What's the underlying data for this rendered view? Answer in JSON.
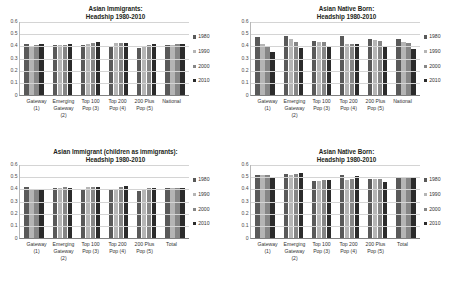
{
  "charts": [
    {
      "title_line1": "Asian Immigrants:",
      "title_line2": "Headship 1980-2010",
      "categories": [
        [
          "Gateway",
          "(1)"
        ],
        [
          "Emerging",
          "Gateway",
          "(2)"
        ],
        [
          "Top 100",
          "Pop (3)"
        ],
        [
          "Top 200",
          "Pop (4)"
        ],
        [
          "200 Plus",
          "Pop (5)"
        ],
        [
          "National"
        ]
      ],
      "series": [
        {
          "name": "1980",
          "values": [
            0.415,
            0.405,
            0.402,
            0.388,
            0.377,
            0.405
          ]
        },
        {
          "name": "1990",
          "values": [
            0.385,
            0.404,
            0.413,
            0.417,
            0.398,
            0.404
          ]
        },
        {
          "name": "2000",
          "values": [
            0.404,
            0.406,
            0.419,
            0.419,
            0.405,
            0.41
          ]
        },
        {
          "name": "2010",
          "values": [
            0.41,
            0.412,
            0.428,
            0.423,
            0.41,
            0.415
          ]
        }
      ]
    },
    {
      "title_line1": "Asian Native Born:",
      "title_line2": "Headship 1980-2010",
      "categories": [
        [
          "Gateway",
          "(1)"
        ],
        [
          "Emerging",
          "Gateway",
          "(2)"
        ],
        [
          "Top 100",
          "Pop (3)"
        ],
        [
          "Top 200",
          "Pop (4)"
        ],
        [
          "200 Plus",
          "Pop (5)"
        ],
        [
          "National"
        ]
      ],
      "series": [
        {
          "name": "1980",
          "values": [
            0.466,
            0.476,
            0.434,
            0.474,
            0.455,
            0.451
          ]
        },
        {
          "name": "1990",
          "values": [
            0.412,
            0.449,
            0.43,
            0.411,
            0.441,
            0.425
          ]
        },
        {
          "name": "2000",
          "values": [
            0.391,
            0.432,
            0.425,
            0.41,
            0.438,
            0.417
          ]
        },
        {
          "name": "2010",
          "values": [
            0.349,
            0.379,
            0.399,
            0.414,
            0.396,
            0.37
          ]
        }
      ]
    },
    {
      "title_line1": "Asian Immigrant (children as immigrants):",
      "title_line2": "Headship 1980-2010",
      "categories": [
        [
          "Gateway",
          "(1)"
        ],
        [
          "Emerging",
          "Gateway",
          "(2)"
        ],
        [
          "Top 100",
          "Pop (3)"
        ],
        [
          "Top 200",
          "Pop (4)"
        ],
        [
          "200 Plus",
          "Pop (5)"
        ],
        [
          "Total"
        ]
      ],
      "series": [
        {
          "name": "1980",
          "values": [
            0.413,
            0.402,
            0.399,
            0.389,
            0.379,
            0.404
          ]
        },
        {
          "name": "1990",
          "values": [
            0.387,
            0.404,
            0.411,
            0.399,
            0.396,
            0.404
          ]
        },
        {
          "name": "2000",
          "values": [
            0.392,
            0.41,
            0.412,
            0.415,
            0.402,
            0.404
          ]
        },
        {
          "name": "2010",
          "values": [
            0.392,
            0.407,
            0.412,
            0.418,
            0.404,
            0.404
          ]
        }
      ]
    },
    {
      "title_line1": "Asian Native Born:",
      "title_line2": "Headship 1980-2010",
      "categories": [
        [
          "Gateway",
          "(1)"
        ],
        [
          "Emerging",
          "Gateway",
          "(2)"
        ],
        [
          "Top 100",
          "Pop (3)"
        ],
        [
          "Top 200",
          "Pop (4)"
        ],
        [
          "200 Plus",
          "Pop (5)"
        ],
        [
          "Total"
        ]
      ],
      "series": [
        {
          "name": "1980",
          "values": [
            0.508,
            0.514,
            0.458,
            0.512,
            0.474,
            0.487
          ]
        },
        {
          "name": "1990",
          "values": [
            0.509,
            0.512,
            0.461,
            0.466,
            0.478,
            0.482
          ]
        },
        {
          "name": "2000",
          "values": [
            0.511,
            0.518,
            0.47,
            0.478,
            0.477,
            0.49
          ]
        },
        {
          "name": "2010",
          "values": [
            0.497,
            0.529,
            0.472,
            0.505,
            0.454,
            0.492
          ]
        }
      ]
    }
  ],
  "axis": {
    "ticks": [
      "0.6",
      "0.5",
      "0.4",
      "0.3",
      "0.2",
      "0.1",
      "0"
    ],
    "ymin": 0,
    "ymax": 0.6
  },
  "colors": {
    "series_1980": "#595959",
    "series_1990": "#b5b5b5",
    "series_2000": "#868686",
    "series_2010": "#2b2b2b"
  },
  "chart_data": {
    "type": "bar",
    "panels": [
      {
        "title": "Asian Immigrants: Headship 1980-2010",
        "categories": [
          "Gateway (1)",
          "Emerging Gateway (2)",
          "Top 100 Pop (3)",
          "Top 200 Pop (4)",
          "200 Plus Pop (5)",
          "National"
        ],
        "series": [
          {
            "name": "1980",
            "values": [
              0.415,
              0.405,
              0.402,
              0.388,
              0.377,
              0.405
            ]
          },
          {
            "name": "1990",
            "values": [
              0.385,
              0.404,
              0.413,
              0.417,
              0.398,
              0.404
            ]
          },
          {
            "name": "2000",
            "values": [
              0.404,
              0.406,
              0.419,
              0.419,
              0.405,
              0.41
            ]
          },
          {
            "name": "2010",
            "values": [
              0.41,
              0.412,
              0.428,
              0.423,
              0.41,
              0.415
            ]
          }
        ],
        "ylim": [
          0,
          0.6
        ],
        "xlabel": "",
        "ylabel": "",
        "grid": true,
        "legend_position": "right"
      },
      {
        "title": "Asian Native Born: Headship 1980-2010",
        "categories": [
          "Gateway (1)",
          "Emerging Gateway (2)",
          "Top 100 Pop (3)",
          "Top 200 Pop (4)",
          "200 Plus Pop (5)",
          "National"
        ],
        "series": [
          {
            "name": "1980",
            "values": [
              0.466,
              0.476,
              0.434,
              0.474,
              0.455,
              0.451
            ]
          },
          {
            "name": "1990",
            "values": [
              0.412,
              0.449,
              0.43,
              0.411,
              0.441,
              0.425
            ]
          },
          {
            "name": "2000",
            "values": [
              0.391,
              0.432,
              0.425,
              0.41,
              0.438,
              0.417
            ]
          },
          {
            "name": "2010",
            "values": [
              0.349,
              0.379,
              0.399,
              0.414,
              0.396,
              0.37
            ]
          }
        ],
        "ylim": [
          0,
          0.6
        ],
        "xlabel": "",
        "ylabel": "",
        "grid": true,
        "legend_position": "right"
      },
      {
        "title": "Asian Immigrant (children as immigrants): Headship 1980-2010",
        "categories": [
          "Gateway (1)",
          "Emerging Gateway (2)",
          "Top 100 Pop (3)",
          "Top 200 Pop (4)",
          "200 Plus Pop (5)",
          "Total"
        ],
        "series": [
          {
            "name": "1980",
            "values": [
              0.413,
              0.402,
              0.399,
              0.389,
              0.379,
              0.404
            ]
          },
          {
            "name": "1990",
            "values": [
              0.387,
              0.404,
              0.411,
              0.399,
              0.396,
              0.404
            ]
          },
          {
            "name": "2000",
            "values": [
              0.392,
              0.41,
              0.412,
              0.415,
              0.402,
              0.404
            ]
          },
          {
            "name": "2010",
            "values": [
              0.392,
              0.407,
              0.412,
              0.418,
              0.404,
              0.404
            ]
          }
        ],
        "ylim": [
          0,
          0.6
        ],
        "xlabel": "",
        "ylabel": "",
        "grid": true,
        "legend_position": "right"
      },
      {
        "title": "Asian Native Born: Headship 1980-2010",
        "categories": [
          "Gateway (1)",
          "Emerging Gateway (2)",
          "Top 100 Pop (3)",
          "Top 200 Pop (4)",
          "200 Plus Pop (5)",
          "Total"
        ],
        "series": [
          {
            "name": "1980",
            "values": [
              0.508,
              0.514,
              0.458,
              0.512,
              0.474,
              0.487
            ]
          },
          {
            "name": "1990",
            "values": [
              0.509,
              0.512,
              0.461,
              0.466,
              0.478,
              0.482
            ]
          },
          {
            "name": "2000",
            "values": [
              0.511,
              0.518,
              0.47,
              0.478,
              0.477,
              0.49
            ]
          },
          {
            "name": "2010",
            "values": [
              0.497,
              0.529,
              0.472,
              0.505,
              0.454,
              0.492
            ]
          }
        ],
        "ylim": [
          0,
          0.6
        ],
        "xlabel": "",
        "ylabel": "",
        "grid": true,
        "legend_position": "right"
      }
    ]
  }
}
